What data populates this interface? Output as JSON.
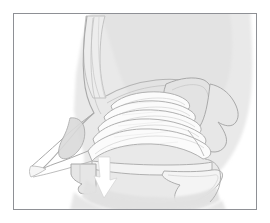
{
  "figure": {
    "domain": "illustration",
    "style": "grayscale line drawing",
    "frame": {
      "border_color": "#8e9095",
      "border_width_px": 1,
      "background_color": "#ffffff",
      "left_px": 13,
      "top_px": 13,
      "width_px": 244,
      "height_px": 197
    },
    "palette": {
      "page_background": "#ffffff",
      "head_silhouette_fill": "#e4e4e4",
      "cavity_fill": "#fbfbfb",
      "bone_fill": "#e6e6e6",
      "soft_tissue_fill": "#e2e2e2",
      "outline_stroke": "#a9a9a9",
      "detail_stroke": "#cccccc",
      "arrow_fill": "#ffffff"
    },
    "structures": [
      {
        "name": "head-silhouette",
        "label": "Head and face profile"
      },
      {
        "name": "frontal-sinus-region",
        "label": "Frontal sinus / nasal bridge"
      },
      {
        "name": "ethmoid-roof",
        "label": "Ethmoid roof / cribriform plate"
      },
      {
        "name": "sphenoid-sinus",
        "label": "Sphenoid sinus"
      },
      {
        "name": "skull-base-posterior",
        "label": "Posterior skull base"
      },
      {
        "name": "superior-turbinate",
        "label": "Superior nasal concha"
      },
      {
        "name": "middle-turbinate-upper",
        "label": "Upper middle concha scroll"
      },
      {
        "name": "middle-turbinate",
        "label": "Middle nasal concha"
      },
      {
        "name": "inferior-turbinate-upper",
        "label": "Upper inferior concha scroll"
      },
      {
        "name": "inferior-turbinate",
        "label": "Inferior nasal concha"
      },
      {
        "name": "nasal-vestibule",
        "label": "Nasal vestibule and nostril"
      },
      {
        "name": "alar-cartilage",
        "label": "Alar cartilage"
      },
      {
        "name": "hard-palate",
        "label": "Hard palate"
      },
      {
        "name": "maxillary-alveolar-process",
        "label": "Maxillary alveolar process"
      },
      {
        "name": "soft-palate",
        "label": "Soft palate and uvula"
      },
      {
        "name": "tongue-and-oral-floor",
        "label": "Tongue and oral cavity floor"
      },
      {
        "name": "nasopharynx-wall",
        "label": "Nasopharyngeal posterior wall"
      },
      {
        "name": "mandible-silhouette",
        "label": "Mandible and chin"
      },
      {
        "name": "airflow-arrow-icon",
        "label": "Airflow direction arrow"
      }
    ],
    "annotations": {
      "text_labels": [],
      "arrow_count": 1,
      "arrow_direction": "down"
    }
  }
}
